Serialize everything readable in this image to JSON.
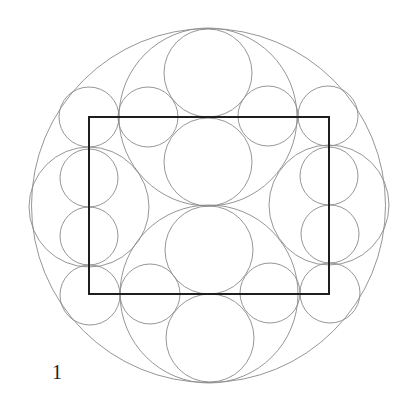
{
  "figure": {
    "label": "1",
    "stroke_color": "#8a8a8a",
    "rect_color": "#1e1e1e",
    "outer_circle": {
      "cx": 208.5,
      "cy": 205.5,
      "r": 177
    },
    "rectangle": {
      "x": 89,
      "y": 117,
      "width": 240,
      "height": 177
    },
    "arc_circles": [
      {
        "cx": 208,
        "cy": 117,
        "r": 89
      },
      {
        "cx": 209,
        "cy": 294,
        "r": 89
      },
      {
        "cx": 89,
        "cy": 207,
        "r": 60
      },
      {
        "cx": 329,
        "cy": 205,
        "r": 60
      }
    ],
    "large_circles": [
      {
        "cx": 208,
        "cy": 73,
        "r": 44
      },
      {
        "cx": 208,
        "cy": 162,
        "r": 44
      },
      {
        "cx": 209,
        "cy": 250,
        "r": 44
      },
      {
        "cx": 210,
        "cy": 338,
        "r": 44
      }
    ],
    "small_circles": [
      {
        "cx": 89,
        "cy": 117,
        "r": 30
      },
      {
        "cx": 148,
        "cy": 117,
        "r": 30
      },
      {
        "cx": 268,
        "cy": 116,
        "r": 30
      },
      {
        "cx": 328,
        "cy": 116,
        "r": 30
      },
      {
        "cx": 89,
        "cy": 178,
        "r": 29
      },
      {
        "cx": 89,
        "cy": 236,
        "r": 29
      },
      {
        "cx": 329,
        "cy": 176,
        "r": 29
      },
      {
        "cx": 330,
        "cy": 234,
        "r": 29
      },
      {
        "cx": 90,
        "cy": 295,
        "r": 30
      },
      {
        "cx": 150,
        "cy": 294,
        "r": 30
      },
      {
        "cx": 270,
        "cy": 293,
        "r": 30
      },
      {
        "cx": 330,
        "cy": 293,
        "r": 30
      }
    ]
  }
}
